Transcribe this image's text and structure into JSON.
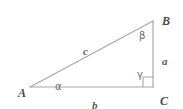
{
  "figure": {
    "type": "geometry-diagram",
    "shape": "right-triangle",
    "background_color": "#ffffff",
    "stroke_color": "#a8a8a8",
    "text_color": "#5b5b5b"
  },
  "vertices": [
    {
      "name": "A",
      "label": "A",
      "x": 30,
      "y": 87,
      "label_x": 18,
      "label_y": 87
    },
    {
      "name": "B",
      "label": "B",
      "x": 153,
      "y": 21,
      "label_x": 162,
      "label_y": 15
    },
    {
      "name": "C",
      "label": "C",
      "x": 153,
      "y": 87,
      "label_x": 160,
      "label_y": 95
    }
  ],
  "sides": [
    {
      "name": "hypotenuse",
      "label": "c",
      "between": "A-B",
      "label_x": 83,
      "label_y": 46
    },
    {
      "name": "base",
      "label": "b",
      "between": "A-C",
      "label_x": 92,
      "label_y": 100
    },
    {
      "name": "vertical",
      "label": "a",
      "between": "B-C",
      "label_x": 162,
      "label_y": 56
    }
  ],
  "angles": [
    {
      "name": "alpha",
      "label": "α",
      "at_vertex": "A",
      "label_x": 55,
      "label_y": 82
    },
    {
      "name": "beta",
      "label": "β",
      "at_vertex": "B",
      "label_x": 139,
      "label_y": 31
    },
    {
      "name": "gamma",
      "label": "γ",
      "at_vertex": "C",
      "label_x": 137,
      "label_y": 70
    }
  ],
  "right_angle_marker": {
    "label": "right-angle-square",
    "at_vertex": "C",
    "x": 143,
    "y": 77,
    "size": 10
  }
}
